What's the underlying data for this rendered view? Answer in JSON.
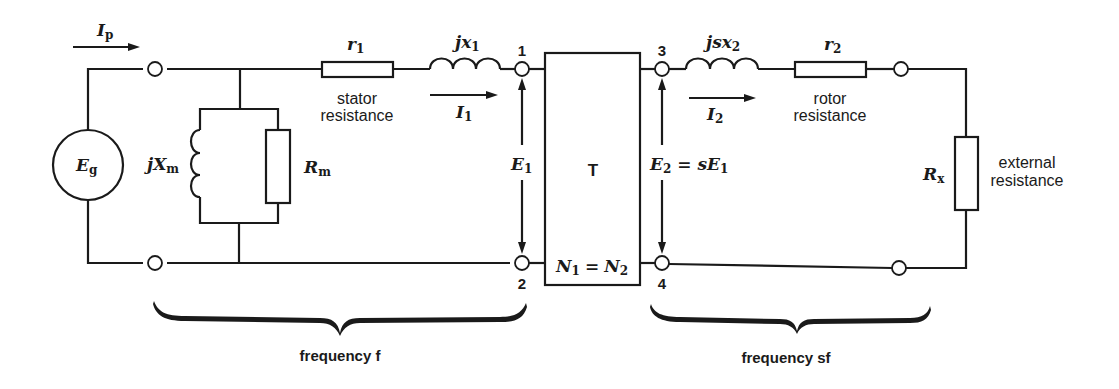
{
  "diagram": {
    "type": "equivalent-circuit",
    "source": {
      "symbol": "E",
      "subscript": "g"
    },
    "currents": {
      "primary": {
        "symbol": "I",
        "subscript": "p"
      },
      "stator": {
        "symbol": "I",
        "subscript": "1"
      },
      "rotor": {
        "symbol": "I",
        "subscript": "2"
      }
    },
    "magnetizing": {
      "reactance": {
        "prefix": "jX",
        "subscript": "m"
      },
      "resistance": {
        "symbol": "R",
        "subscript": "m"
      }
    },
    "stator": {
      "resistance": {
        "symbol": "r",
        "subscript": "1",
        "label_line1": "stator",
        "label_line2": "resistance"
      },
      "reactance": {
        "prefix": "jx",
        "subscript": "1"
      }
    },
    "transformer": {
      "label": "T",
      "turns_ratio": {
        "n1": "N",
        "n1_sub": "1",
        "eq": "=",
        "n2": "N",
        "n2_sub": "2"
      }
    },
    "voltages": {
      "e1": {
        "symbol": "E",
        "subscript": "1"
      },
      "e2": {
        "symbol": "E",
        "subscript": "2",
        "rhs": "= sE",
        "rhs_sub": "1"
      }
    },
    "nodes": [
      "1",
      "2",
      "3",
      "4"
    ],
    "rotor": {
      "reactance": {
        "prefix": "jsx",
        "subscript": "2"
      },
      "resistance": {
        "symbol": "r",
        "subscript": "2",
        "label_line1": "rotor",
        "label_line2": "resistance"
      }
    },
    "external": {
      "symbol": "R",
      "subscript": "x",
      "label_line1": "external",
      "label_line2": "resistance"
    },
    "braces": {
      "left": "frequency f",
      "right": "frequency sf"
    }
  }
}
